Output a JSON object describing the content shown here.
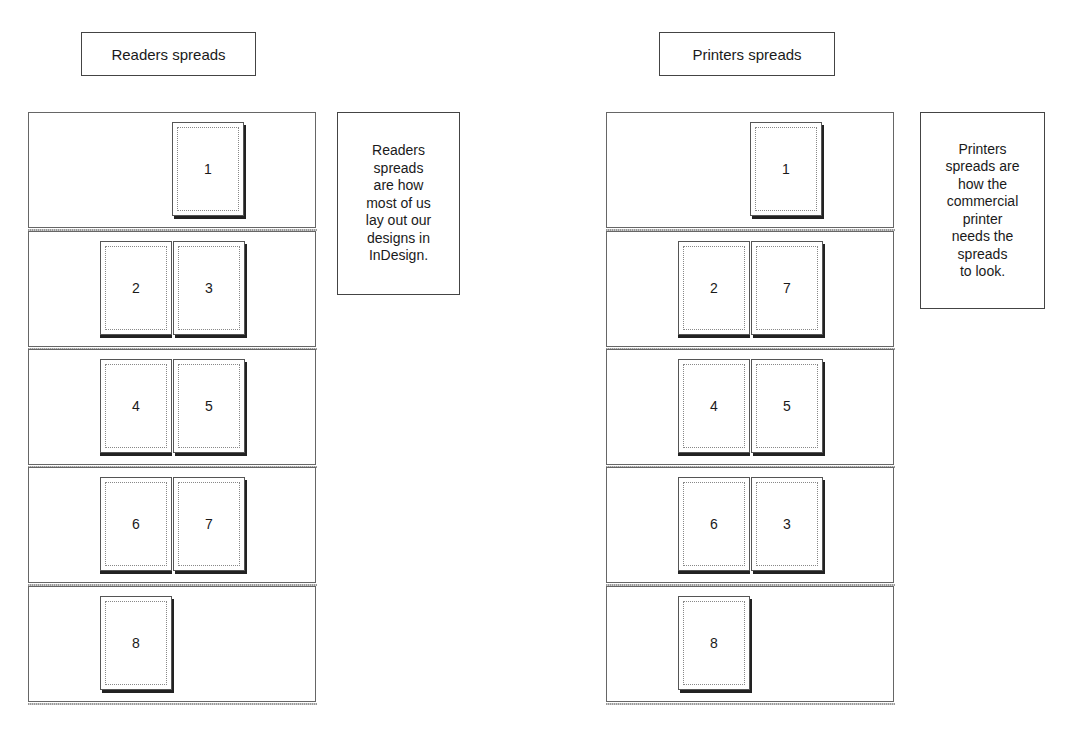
{
  "readers": {
    "title": "Readers spreads",
    "note_lines": [
      "Readers",
      "spreads",
      "are how",
      "most of us",
      "lay out our",
      "designs in",
      "InDesign."
    ],
    "rows": [
      {
        "pages": [
          "1"
        ]
      },
      {
        "pages": [
          "2",
          "3"
        ]
      },
      {
        "pages": [
          "4",
          "5"
        ]
      },
      {
        "pages": [
          "6",
          "7"
        ]
      },
      {
        "pages": [
          "8"
        ]
      }
    ]
  },
  "printers": {
    "title": "Printers spreads",
    "note_lines": [
      "Printers",
      "spreads are",
      "how the",
      "commercial",
      "printer",
      "needs the",
      "spreads",
      "to look."
    ],
    "rows": [
      {
        "pages": [
          "1"
        ]
      },
      {
        "pages": [
          "2",
          "7"
        ]
      },
      {
        "pages": [
          "4",
          "5"
        ]
      },
      {
        "pages": [
          "6",
          "3"
        ]
      },
      {
        "pages": [
          "8"
        ]
      }
    ]
  },
  "colors": {
    "border": "#444444",
    "shadow": "#222222",
    "background": "#ffffff"
  }
}
